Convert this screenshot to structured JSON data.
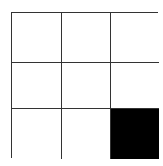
{
  "grid": {
    "rows": 3,
    "cols": 3,
    "line_color": "#333333",
    "empty_color": "#ffffff",
    "filled_color": "#000000",
    "cells": [
      [
        0,
        0,
        0
      ],
      [
        0,
        0,
        0
      ],
      [
        0,
        0,
        1
      ]
    ]
  }
}
